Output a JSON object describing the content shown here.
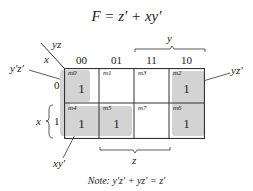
{
  "title": "F = z′ + xy′",
  "map": {
    "corner_col_var": "yz",
    "corner_row_var": "x",
    "column_headers": [
      "00",
      "01",
      "11",
      "10"
    ],
    "row_headers": [
      "0",
      "1"
    ],
    "span_top_label": "y",
    "span_bottom_label": "z",
    "span_left_label": "x",
    "cells": [
      {
        "minterm": "m0",
        "value": "1",
        "row": 0,
        "col": 0
      },
      {
        "minterm": "m1",
        "value": "",
        "row": 0,
        "col": 1
      },
      {
        "minterm": "m3",
        "value": "",
        "row": 0,
        "col": 2
      },
      {
        "minterm": "m2",
        "value": "1",
        "row": 0,
        "col": 3
      },
      {
        "minterm": "m4",
        "value": "1",
        "row": 1,
        "col": 0
      },
      {
        "minterm": "m5",
        "value": "1",
        "row": 1,
        "col": 1
      },
      {
        "minterm": "m7",
        "value": "",
        "row": 1,
        "col": 2
      },
      {
        "minterm": "m6",
        "value": "1",
        "row": 1,
        "col": 3
      }
    ],
    "group_labels": {
      "left_top": "y′z′",
      "right_top": "yz′",
      "bottom_left": "xy′"
    },
    "shade_color": "#d3d3d3"
  },
  "note": {
    "prefix": "Note:",
    "text": " y′z′ + yz′ = z′"
  }
}
